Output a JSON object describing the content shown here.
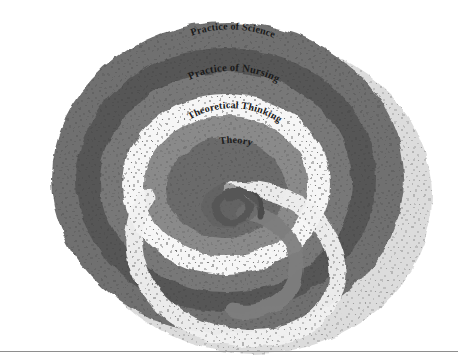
{
  "figure": {
    "name": "nursing-knowledge-spiral",
    "background_color": "#ffffff",
    "width": 458,
    "height": 362,
    "center_x": 228,
    "center_y": 178,
    "has_bottom_rule": true,
    "rule_color": "#8e8e8e"
  },
  "bands": [
    {
      "id": "philosophy-of-nursing",
      "label": "Philosophy of Nursing",
      "color": "#6f6f6f",
      "order": 1,
      "font_size": 10.5,
      "radius": 152
    },
    {
      "id": "philosophy-of-science",
      "label": "Philosophy of Science",
      "color": "#565656",
      "order": 2,
      "font_size": 10.5,
      "radius": 124
    },
    {
      "id": "practice-of-science",
      "label": "Practice of Science",
      "color": "#787878",
      "order": 3,
      "font_size": 10,
      "radius": 98
    },
    {
      "id": "practice-of-nursing",
      "label": "Practice of Nursing",
      "color": "#f6f6f6",
      "order": 4,
      "font_size": 10.5,
      "radius": 74
    },
    {
      "id": "theoretical-thinking",
      "label": "Theoretical Thinking",
      "color": "#8a8a8a",
      "order": 5,
      "font_size": 10,
      "radius": 52
    },
    {
      "id": "theory",
      "label": "Theory",
      "color": "#6a6a6a",
      "order": 6,
      "font_size": 10,
      "radius": 32
    }
  ],
  "shadow": {
    "name": "drop-shadow-layer",
    "color": "#d8d8d8",
    "offset_x": 26,
    "offset_y": 18
  },
  "texture": {
    "speckle_color": "#2a2a2a",
    "description": "fine dark speckle noise over all bands"
  }
}
